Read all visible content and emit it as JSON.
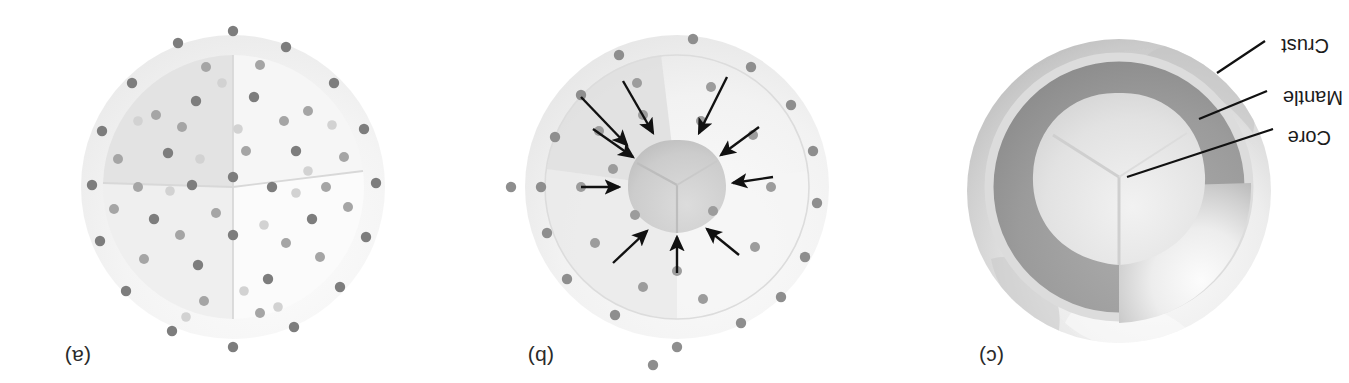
{
  "figure": {
    "caption_free": true,
    "orientation": "rotated-180",
    "background": "#ffffff",
    "width": 1349,
    "height": 383
  },
  "panels": [
    {
      "id": "c",
      "label": "(c)",
      "label_x": 345,
      "label_y": 14,
      "title_semantic": "differentiated-earth",
      "center_x": 230,
      "center_y": 192,
      "radius": 152,
      "layers": [
        {
          "name": "Core",
          "color": "#e3e3e3",
          "radius": 62
        },
        {
          "name": "Mantle",
          "color": "#9a9a9a",
          "radius": 116
        },
        {
          "name": "Crust",
          "color": "#d8d8d8",
          "radius": 124
        }
      ],
      "callouts": [
        {
          "label": "Core",
          "text_x": 18,
          "text_y": 248,
          "line_x1": 76,
          "line_y1": 254,
          "line_x2": 222,
          "line_y2": 206
        },
        {
          "label": "Mantle",
          "text_x": 8,
          "text_y": 288,
          "line_x1": 82,
          "line_y1": 292,
          "line_x2": 150,
          "line_y2": 264
        },
        {
          "label": "Crust",
          "text_x": 22,
          "text_y": 340,
          "line_x1": 84,
          "line_y1": 342,
          "line_x2": 132,
          "line_y2": 310
        }
      ]
    },
    {
      "id": "b",
      "label": "(b)",
      "label_x": 795,
      "label_y": 14,
      "title_semantic": "differentiating-earth",
      "center_x": 672,
      "center_y": 196,
      "radius": 152,
      "core_radius": 46,
      "shell_color": "#efefef",
      "core_color": "#cfcfcf",
      "arrow_color": "#111111",
      "arrow_count": 10,
      "dot_color_dark": "#8e8e8e",
      "dot_color_light": "#c9c9c9"
    },
    {
      "id": "a",
      "label": "(a)",
      "label_x": 1258,
      "label_y": 14,
      "title_semantic": "homogeneous-earth",
      "center_x": 1116,
      "center_y": 196,
      "radius": 152,
      "shell_color": "#f2f2f2",
      "wedge_top_color": "#fbfbfb",
      "wedge_left_color": "#f6f6f6",
      "wedge_right_color": "#e6e6e6",
      "dot_color_dark": "#7d7d7d",
      "dot_color_mid": "#a5a5a5",
      "dot_color_light": "#d2d2d2"
    }
  ],
  "labels": {
    "core": "Core",
    "mantle": "Mantle",
    "crust": "Crust",
    "panel_a": "(a)",
    "panel_b": "(b)",
    "panel_c": "(c)"
  }
}
